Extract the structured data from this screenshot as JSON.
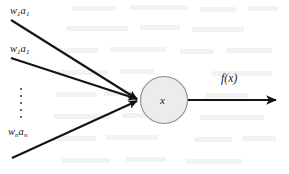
{
  "figure": {
    "type": "neuron-diagram",
    "background_color": "#ffffff",
    "ink_color": "#16161a"
  },
  "node": {
    "label": "x",
    "fill_color": "#ececec",
    "stroke_color": "#8c8c8c",
    "center_x": 164,
    "center_y": 100,
    "radius": 24
  },
  "inputs": [
    {
      "id": "input-1",
      "weight_symbol": "w",
      "weight_subscript": "1",
      "activation_symbol": "a",
      "activation_subscript": "1",
      "label": "w1a1",
      "start_x": 11,
      "start_y": 20
    },
    {
      "id": "input-2",
      "weight_symbol": "w",
      "weight_subscript": "1",
      "activation_symbol": "a",
      "activation_subscript": "1",
      "label": "w1a1",
      "start_x": 11,
      "start_y": 58
    },
    {
      "id": "input-n",
      "weight_symbol": "w",
      "weight_subscript": "n",
      "activation_symbol": "a",
      "activation_subscript": "n",
      "label": "wnan",
      "start_x": 12,
      "start_y": 158
    }
  ],
  "ellipsis": {
    "orientation": "vertical",
    "dot_count": 5
  },
  "output": {
    "label_function": "f",
    "label_open": "(",
    "label_argument": "x",
    "label_close": ")",
    "label": "f(x)",
    "start_x": 188,
    "end_x": 280,
    "y": 100
  },
  "convergence_point": {
    "x": 140,
    "y": 100
  }
}
